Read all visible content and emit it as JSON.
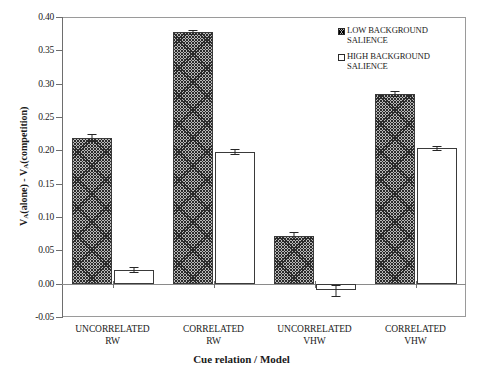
{
  "chart_data": {
    "type": "bar",
    "title": "",
    "xlabel": "Cue relation / Model",
    "ylabel": "V_A(alone) - V_A(competition)",
    "ylabel_parts": {
      "v1": "V",
      "sub1": "A",
      "mid": "(alone) - ",
      "v2": "V",
      "sub2": "A",
      "tail": "(competition)"
    },
    "categories": [
      "UNCORRELATED\nRW",
      "CORRELATED\nRW",
      "UNCORRELATED\nVHW",
      "CORRELATED\nVHW"
    ],
    "category_lines": [
      [
        "UNCORRELATED",
        "RW"
      ],
      [
        "CORRELATED",
        "RW"
      ],
      [
        "UNCORRELATED",
        "VHW"
      ],
      [
        "CORRELATED",
        "VHW"
      ]
    ],
    "series": [
      {
        "name": "LOW BACKGROUND SALIENCE",
        "values": [
          0.219,
          0.378,
          0.072,
          0.285
        ],
        "errors": [
          0.005,
          0.003,
          0.005,
          0.004
        ],
        "fill": "hatched"
      },
      {
        "name": "HIGH BACKGROUND SALIENCE",
        "values": [
          0.021,
          0.198,
          -0.01,
          0.203
        ],
        "errors": [
          0.004,
          0.004,
          0.008,
          0.003
        ],
        "fill": "white"
      }
    ],
    "ylim": [
      -0.05,
      0.4
    ],
    "yticks": [
      0.4,
      0.35,
      0.3,
      0.25,
      0.2,
      0.15,
      0.1,
      0.05,
      0.0,
      -0.05
    ],
    "ytick_labels": [
      "0.40",
      "0.35",
      "0.30",
      "0.25",
      "0.20",
      "0.15",
      "0.10",
      "0.05",
      "0.00",
      "-0.05"
    ],
    "grid": false,
    "legend_position": "top-right",
    "colors": {
      "bar_low_fill": "#b9b9b9",
      "bar_low_hatch": "#2b2b2b",
      "bar_high_fill": "#ffffff",
      "bar_outline": "#3a3a3a",
      "axis": "#6e6e6e",
      "text": "#1a1a1a"
    }
  },
  "legend": {
    "items": [
      {
        "label_line1": "LOW BACKGROUND",
        "label_line2": "SALIENCE",
        "swatch": "hatched-swatch-icon"
      },
      {
        "label_line1": "HIGH BACKGROUND",
        "label_line2": "SALIENCE",
        "swatch": "white-swatch-icon"
      }
    ]
  }
}
